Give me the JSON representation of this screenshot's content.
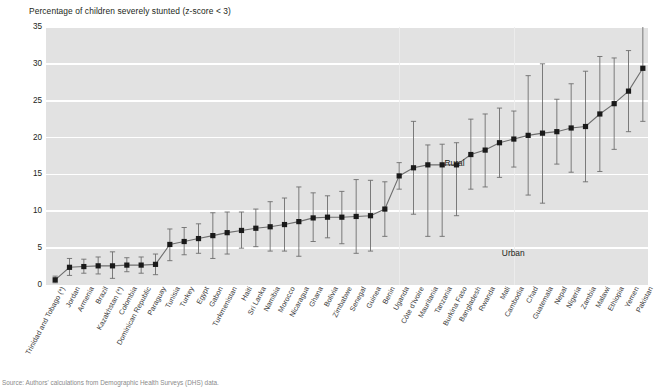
{
  "chart_data": {
    "type": "scatter",
    "title": "Percentage of children severely stunted (z-score < 3)",
    "xlabel": "",
    "ylabel": "",
    "ylim": [
      0,
      35
    ],
    "yticks": [
      0,
      5,
      10,
      15,
      20,
      25,
      30,
      35
    ],
    "grid": true,
    "legend": "none",
    "annotations": [
      {
        "text": "Rural",
        "x_index": 28,
        "y": 16.6
      },
      {
        "text": "Urban",
        "x_index": 32,
        "y": 4.3
      }
    ],
    "marker_color": "#1a1a1a",
    "line_color": "#6e6e6e",
    "errorbar_color": "#6e6e6e",
    "plot_bg": "#e2e2e2",
    "categories": [
      "Trinidad and Tobago (*)",
      "Jordan",
      "Armenia",
      "Brazil",
      "Kazakhstan (*)",
      "Colombia",
      "Dominican Republic",
      "Paraguay",
      "Tunisia",
      "Turkey",
      "Egypt",
      "Gabon",
      "Turkmenistan",
      "Haiti",
      "Sri Lanka",
      "Namibia",
      "Morocco",
      "Nicaragua",
      "Ghana",
      "Bolivia",
      "Zimbabwe",
      "Senegal",
      "Guinea",
      "Benin",
      "Uganda",
      "Côte d'Ivoire",
      "Mauritania",
      "Tanzania",
      "Burkina Faso",
      "Bangladesh",
      "Rwanda",
      "Mali",
      "Cambodia",
      "Chad",
      "Guatemala",
      "Nepal",
      "Nigeria",
      "Zambia",
      "Malawi",
      "Ethiopia",
      "Yemen",
      "Pakistan"
    ],
    "values": [
      0.7,
      2.4,
      2.5,
      2.6,
      2.6,
      2.7,
      2.7,
      2.8,
      5.5,
      5.9,
      6.3,
      6.7,
      7.1,
      7.4,
      7.7,
      7.9,
      8.2,
      8.6,
      9.1,
      9.2,
      9.2,
      9.3,
      9.4,
      10.3,
      14.8,
      15.9,
      16.3,
      16.3,
      16.3,
      17.7,
      18.3,
      19.3,
      19.8,
      20.3,
      20.6,
      20.8,
      21.3,
      21.5,
      23.2,
      24.6,
      26.3,
      29.4
    ],
    "err_low": [
      0.3,
      1.3,
      1.6,
      1.5,
      0.9,
      1.8,
      1.6,
      1.4,
      3.3,
      4.1,
      4.3,
      3.6,
      4.2,
      5.0,
      5.2,
      4.6,
      4.6,
      3.9,
      5.9,
      6.4,
      5.6,
      4.3,
      4.6,
      6.6,
      13.0,
      9.6,
      6.6,
      6.6,
      9.4,
      13.0,
      13.3,
      14.6,
      16.0,
      12.2,
      11.1,
      16.4,
      15.3,
      14.0,
      15.4,
      18.4,
      20.8,
      22.2
    ],
    "err_high": [
      1.2,
      3.6,
      3.5,
      3.8,
      4.5,
      3.7,
      3.8,
      4.2,
      7.6,
      7.8,
      8.3,
      9.8,
      9.9,
      9.9,
      10.3,
      11.3,
      11.8,
      13.3,
      12.5,
      12.1,
      12.7,
      14.3,
      14.2,
      14.0,
      16.6,
      22.2,
      19.0,
      19.1,
      19.3,
      22.5,
      23.2,
      24.0,
      23.6,
      28.4,
      30.0,
      25.2,
      27.3,
      29.0,
      31.0,
      30.8,
      31.8,
      36.8
    ]
  },
  "source": {
    "text": "Source: Authors' calculations from Demographic Health Surveys (DHS) data."
  }
}
